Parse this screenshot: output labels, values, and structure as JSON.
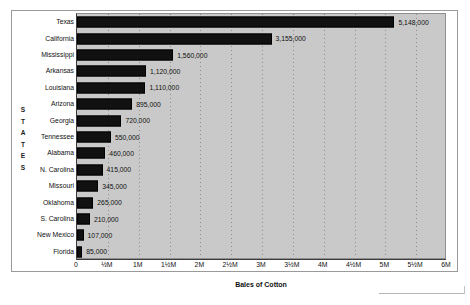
{
  "chart_data": {
    "type": "bar",
    "orientation": "horizontal",
    "title": "",
    "xlabel": "Bales of Cotton",
    "ylabel": "STATES",
    "ylabel_spaced": "S\nT\nA\nT\nE\nS",
    "xlim": [
      0,
      6000000
    ],
    "grid": true,
    "legend": null,
    "categories": [
      "Texas",
      "California",
      "Mississippi",
      "Arkansas",
      "Louisiana",
      "Arizona",
      "Georgia",
      "Tennessee",
      "Alabama",
      "N. Carolina",
      "Missouri",
      "Oklahoma",
      "S. Carolina",
      "New Mexico",
      "Florida"
    ],
    "values": [
      5148000,
      3155000,
      1560000,
      1120000,
      1110000,
      895000,
      720000,
      550000,
      460000,
      415000,
      345000,
      265000,
      210000,
      107000,
      85000
    ],
    "value_labels": [
      "5,148,000",
      "3,155,000",
      "1,560,000",
      "1,120,000",
      "1,110,000",
      "895,000",
      "720,000",
      "550,000",
      "460,000",
      "415,000",
      "345,000",
      "265,000",
      "210,000",
      "107,000",
      "85,000"
    ],
    "xticks": [
      0,
      500000,
      1000000,
      1500000,
      2000000,
      2500000,
      3000000,
      3500000,
      4000000,
      4500000,
      5000000,
      5500000,
      6000000
    ],
    "xtick_labels": [
      "0",
      "½M",
      "1M",
      "1½M",
      "2M",
      "2½M",
      "3M",
      "3½M",
      "4M",
      "4½M",
      "5M",
      "5½M",
      "6M"
    ],
    "colors": {
      "bar": "#111111",
      "plot_background": "#c9c9c9",
      "figure_background": "#ffffff",
      "gridline": "#8c8c8c",
      "axis": "#3b3b3b",
      "text": "#101010"
    }
  }
}
